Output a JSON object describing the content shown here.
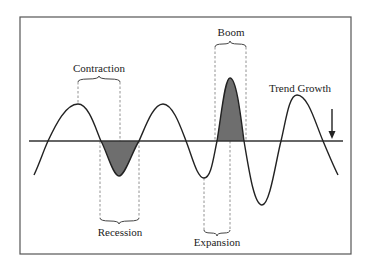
{
  "diagram": {
    "labels": {
      "contraction": "Contraction",
      "boom": "Boom",
      "trend_growth": "Trend Growth",
      "recession": "Recession",
      "expansion": "Expansion"
    },
    "colors": {
      "line": "#222222",
      "shade": "#6e6e6e",
      "dashed": "#777777",
      "frame": "#555555"
    }
  }
}
